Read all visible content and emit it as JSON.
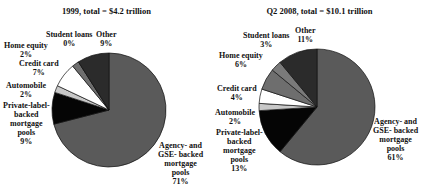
{
  "chart_data": [
    {
      "type": "pie",
      "title": "1999, total = $4.2 trillion",
      "categories": [
        "Agency- and GSE- backed mortgage pools",
        "Private-label-backed mortgage pools",
        "Automobile",
        "Credit card",
        "Home equity",
        "Student loans",
        "Other"
      ],
      "values": [
        71,
        9,
        2,
        7,
        2,
        0,
        9
      ],
      "labels": [
        "71%",
        "9%",
        "2%",
        "7%",
        "2%",
        "0%",
        "9%"
      ],
      "colors": [
        "#5a5a5a",
        "#050505",
        "#c8c8c8",
        "#ffffff",
        "#6e6e6e",
        "#7a7a7a",
        "#2b2b2b"
      ],
      "start_angle_deg": 0,
      "direction": "clockwise",
      "units": "percent of total"
    },
    {
      "type": "pie",
      "title": "Q2 2008, total = $10.1 trillion",
      "categories": [
        "Agency- and GSE- backed mortgage pools",
        "Private-label-backed mortgage pools",
        "Automobile",
        "Credit card",
        "Home equity",
        "Student loans",
        "Other"
      ],
      "values": [
        61,
        13,
        2,
        4,
        6,
        3,
        11
      ],
      "labels": [
        "61%",
        "13%",
        "2%",
        "4%",
        "6%",
        "3%",
        "11%"
      ],
      "colors": [
        "#5a5a5a",
        "#050505",
        "#c8c8c8",
        "#ffffff",
        "#6e6e6e",
        "#7a7a7a",
        "#2b2b2b"
      ],
      "start_angle_deg": 0,
      "direction": "clockwise",
      "units": "percent of total"
    }
  ],
  "panels": [
    {
      "title": "1999, total = $4.2 trillion",
      "labels": {
        "student_loans": {
          "name": "Student loans",
          "pct": "0%"
        },
        "other": {
          "name": "Other",
          "pct": "9%"
        },
        "home_equity": {
          "name": "Home equity",
          "pct": "2%"
        },
        "credit_card": {
          "name": "Credit card",
          "pct": "7%"
        },
        "automobile": {
          "name": "Automobile",
          "pct": "2%"
        },
        "private_label": {
          "l1": "Private-label-",
          "l2": "backed",
          "l3": "mortgage",
          "l4": "pools",
          "pct": "9%"
        },
        "agency": {
          "l1": "Agency- and",
          "l2": "GSE- backed",
          "l3": "mortgage",
          "l4": "pools",
          "pct": "71%"
        }
      }
    },
    {
      "title": "Q2 2008, total = $10.1 trillion",
      "labels": {
        "student_loans": {
          "name": "Student loans",
          "pct": "3%"
        },
        "other": {
          "name": "Other",
          "pct": "11%"
        },
        "home_equity": {
          "name": "Home equity",
          "pct": "6%"
        },
        "credit_card": {
          "name": "Credit card",
          "pct": "4%"
        },
        "automobile": {
          "name": "Automobile",
          "pct": "2%"
        },
        "private_label": {
          "l1": "Private-label-",
          "l2": "backed",
          "l3": "mortgage",
          "l4": "pools",
          "pct": "13%"
        },
        "agency": {
          "l1": "Agency- and",
          "l2": "GSE- backed",
          "l3": "mortgage",
          "l4": "pools",
          "pct": "61%"
        }
      }
    }
  ]
}
